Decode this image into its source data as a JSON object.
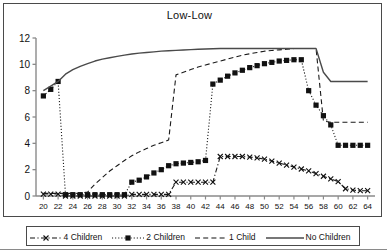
{
  "chart_data": {
    "type": "line",
    "title": "Low-Low",
    "xlabel": "",
    "ylabel": "",
    "xlim": [
      19,
      65
    ],
    "ylim": [
      0,
      12
    ],
    "yticks": [
      0,
      2,
      4,
      6,
      8,
      10,
      12
    ],
    "xticks": [
      20,
      22,
      24,
      26,
      28,
      30,
      32,
      34,
      36,
      38,
      40,
      42,
      44,
      46,
      48,
      50,
      52,
      54,
      56,
      58,
      60,
      62,
      64
    ],
    "grid": false,
    "legend_position": "bottom",
    "x": [
      20,
      21,
      22,
      23,
      24,
      25,
      26,
      27,
      28,
      29,
      30,
      31,
      32,
      33,
      34,
      35,
      36,
      37,
      38,
      39,
      40,
      41,
      42,
      43,
      44,
      45,
      46,
      47,
      48,
      49,
      50,
      51,
      52,
      53,
      54,
      55,
      56,
      57,
      58,
      59,
      60,
      61,
      62,
      63,
      64
    ],
    "series": [
      {
        "name": "4 Children",
        "marker": "x",
        "linestyle": "dash-dot",
        "color": "#1a1a1a",
        "values": [
          0.15,
          0.15,
          0.15,
          0.0,
          0.0,
          0.0,
          0.0,
          0.0,
          0.0,
          0.0,
          0.0,
          0.0,
          0.12,
          0.12,
          0.12,
          0.12,
          0.12,
          0.12,
          1.05,
          1.05,
          1.05,
          1.05,
          1.05,
          1.05,
          3.0,
          3.0,
          3.0,
          3.0,
          2.95,
          2.9,
          2.8,
          2.65,
          2.5,
          2.35,
          2.2,
          2.05,
          1.9,
          1.7,
          1.5,
          1.3,
          1.1,
          0.55,
          0.45,
          0.4,
          0.4
        ]
      },
      {
        "name": "2 Children",
        "marker": "square",
        "linestyle": "dotted",
        "color": "#1a1a1a",
        "values": [
          7.6,
          8.1,
          8.7,
          0.1,
          0.1,
          0.1,
          0.1,
          0.1,
          0.1,
          0.1,
          0.1,
          0.1,
          1.05,
          1.2,
          1.45,
          1.75,
          2.0,
          2.3,
          2.45,
          2.5,
          2.55,
          2.6,
          2.7,
          8.5,
          8.8,
          9.1,
          9.35,
          9.55,
          9.75,
          9.9,
          10.05,
          10.15,
          10.25,
          10.3,
          10.35,
          10.35,
          8.0,
          6.9,
          6.1,
          5.4,
          3.85,
          3.85,
          3.85,
          3.85,
          3.85
        ]
      },
      {
        "name": "1 Child",
        "marker": "none",
        "linestyle": "dashed",
        "color": "#1a1a1a",
        "values": [
          0.2,
          0.2,
          0.2,
          0.2,
          0.2,
          0.2,
          0.3,
          0.9,
          1.4,
          1.9,
          2.3,
          2.7,
          3.05,
          3.35,
          3.6,
          3.85,
          4.05,
          4.25,
          9.2,
          9.4,
          9.6,
          9.8,
          9.95,
          10.1,
          10.25,
          10.4,
          10.55,
          10.7,
          10.8,
          10.9,
          11.0,
          11.05,
          11.1,
          11.15,
          11.2,
          11.2,
          11.2,
          11.2,
          5.7,
          5.6,
          5.6,
          5.6,
          5.6,
          5.6,
          5.6
        ]
      },
      {
        "name": "No Children",
        "marker": "none",
        "linestyle": "solid",
        "color": "#4a4a4a",
        "values": [
          8.0,
          8.35,
          8.7,
          9.25,
          9.6,
          9.85,
          10.05,
          10.25,
          10.4,
          10.5,
          10.6,
          10.7,
          10.78,
          10.85,
          10.9,
          10.95,
          11.0,
          11.03,
          11.06,
          11.09,
          11.12,
          11.15,
          11.17,
          11.18,
          11.2,
          11.2,
          11.2,
          11.2,
          11.2,
          11.2,
          11.2,
          11.2,
          11.2,
          11.2,
          11.2,
          11.2,
          11.2,
          11.2,
          9.4,
          8.7,
          8.7,
          8.7,
          8.7,
          8.7,
          8.7
        ]
      }
    ]
  },
  "legend": {
    "items": [
      {
        "label": "4 Children",
        "sample": "dash-dot-x"
      },
      {
        "label": "2 Children",
        "sample": "dotted-square"
      },
      {
        "label": "1 Child",
        "sample": "dashed"
      },
      {
        "label": "No Children",
        "sample": "solid"
      }
    ]
  }
}
